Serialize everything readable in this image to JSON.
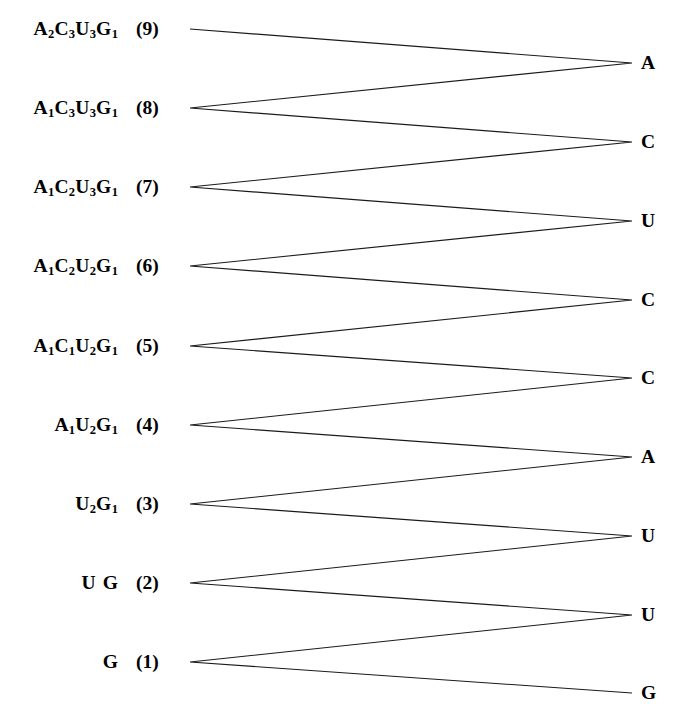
{
  "figure": {
    "background_color": "#ffffff",
    "line_color": "#1a1a1a",
    "text_color": "#000000"
  },
  "left_column": {
    "rows": [
      {
        "index_label": "(9)",
        "composition_plain": "A2C3U3G1",
        "parts": [
          {
            "letter": "A",
            "sub": "2"
          },
          {
            "letter": "C",
            "sub": "3"
          },
          {
            "letter": "U",
            "sub": "3"
          },
          {
            "letter": "G",
            "sub": "1"
          }
        ]
      },
      {
        "index_label": "(8)",
        "composition_plain": "A1C3U3G1",
        "parts": [
          {
            "letter": "A",
            "sub": "1"
          },
          {
            "letter": "C",
            "sub": "3"
          },
          {
            "letter": "U",
            "sub": "3"
          },
          {
            "letter": "G",
            "sub": "1"
          }
        ]
      },
      {
        "index_label": "(7)",
        "composition_plain": "A1C2U3G1",
        "parts": [
          {
            "letter": "A",
            "sub": "1"
          },
          {
            "letter": "C",
            "sub": "2"
          },
          {
            "letter": "U",
            "sub": "3"
          },
          {
            "letter": "G",
            "sub": "1"
          }
        ]
      },
      {
        "index_label": "(6)",
        "composition_plain": "A1C2U2G1",
        "parts": [
          {
            "letter": "A",
            "sub": "1"
          },
          {
            "letter": "C",
            "sub": "2"
          },
          {
            "letter": "U",
            "sub": "2"
          },
          {
            "letter": "G",
            "sub": "1"
          }
        ]
      },
      {
        "index_label": "(5)",
        "composition_plain": "A1C1U2G1",
        "parts": [
          {
            "letter": "A",
            "sub": "1"
          },
          {
            "letter": "C",
            "sub": "1"
          },
          {
            "letter": "U",
            "sub": "2"
          },
          {
            "letter": "G",
            "sub": "1"
          }
        ]
      },
      {
        "index_label": "(4)",
        "composition_plain": "A1U2G1",
        "parts": [
          {
            "letter": "A",
            "sub": "1"
          },
          {
            "letter": "U",
            "sub": "2"
          },
          {
            "letter": "G",
            "sub": "1"
          }
        ]
      },
      {
        "index_label": "(3)",
        "composition_plain": "U2G1",
        "parts": [
          {
            "letter": "U",
            "sub": "2"
          },
          {
            "letter": "G",
            "sub": "1"
          }
        ]
      },
      {
        "index_label": "(2)",
        "composition_plain": "U G",
        "parts": [
          {
            "letter": "U",
            "sub": ""
          },
          {
            "letter": "",
            "sub": ""
          },
          {
            "letter": "G",
            "sub": ""
          }
        ]
      },
      {
        "index_label": "(1)",
        "composition_plain": "G",
        "parts": [
          {
            "letter": "G",
            "sub": ""
          }
        ]
      }
    ]
  },
  "right_column": {
    "bases": [
      "A",
      "C",
      "U",
      "C",
      "C",
      "A",
      "U",
      "U",
      "G"
    ]
  },
  "chart_data": {
    "type": "diagram",
    "title": "",
    "left_nodes": [
      {
        "id": 9,
        "label": "A2C3U3G1",
        "index": "(9)",
        "x": 190,
        "y": 29
      },
      {
        "id": 8,
        "label": "A1C3U3G1",
        "index": "(8)",
        "x": 190,
        "y": 108
      },
      {
        "id": 7,
        "label": "A1C2U3G1",
        "index": "(7)",
        "x": 190,
        "y": 187
      },
      {
        "id": 6,
        "label": "A1C2U2G1",
        "index": "(6)",
        "x": 190,
        "y": 266
      },
      {
        "id": 5,
        "label": "A1C1U2G1",
        "index": "(5)",
        "x": 190,
        "y": 346
      },
      {
        "id": 4,
        "label": "A1U2G1",
        "index": "(4)",
        "x": 190,
        "y": 425
      },
      {
        "id": 3,
        "label": "U2G1",
        "index": "(3)",
        "x": 190,
        "y": 504
      },
      {
        "id": 2,
        "label": "U G",
        "index": "(2)",
        "x": 190,
        "y": 583
      },
      {
        "id": 1,
        "label": "G",
        "index": "(1)",
        "x": 190,
        "y": 662
      }
    ],
    "right_nodes": [
      {
        "id": 1,
        "base": "A",
        "x": 632,
        "y": 63
      },
      {
        "id": 2,
        "base": "C",
        "x": 632,
        "y": 142
      },
      {
        "id": 3,
        "base": "U",
        "x": 632,
        "y": 221
      },
      {
        "id": 4,
        "base": "C",
        "x": 632,
        "y": 300
      },
      {
        "id": 5,
        "base": "C",
        "x": 632,
        "y": 378
      },
      {
        "id": 6,
        "base": "A",
        "x": 632,
        "y": 457
      },
      {
        "id": 7,
        "base": "U",
        "x": 632,
        "y": 536
      },
      {
        "id": 8,
        "base": "U",
        "x": 632,
        "y": 615
      },
      {
        "id": 9,
        "base": "G",
        "x": 632,
        "y": 693
      }
    ],
    "edges": [
      {
        "from_left": 9,
        "to_right": 1
      },
      {
        "from_right": 1,
        "to_left": 8
      },
      {
        "from_left": 8,
        "to_right": 2
      },
      {
        "from_right": 2,
        "to_left": 7
      },
      {
        "from_left": 7,
        "to_right": 3
      },
      {
        "from_right": 3,
        "to_left": 6
      },
      {
        "from_left": 6,
        "to_right": 4
      },
      {
        "from_right": 4,
        "to_left": 5
      },
      {
        "from_left": 5,
        "to_right": 5
      },
      {
        "from_right": 5,
        "to_left": 4
      },
      {
        "from_left": 4,
        "to_right": 6
      },
      {
        "from_right": 6,
        "to_left": 3
      },
      {
        "from_left": 3,
        "to_right": 7
      },
      {
        "from_right": 7,
        "to_left": 2
      },
      {
        "from_left": 2,
        "to_right": 8
      },
      {
        "from_right": 8,
        "to_left": 1
      },
      {
        "from_left": 1,
        "to_right": 9
      }
    ]
  }
}
